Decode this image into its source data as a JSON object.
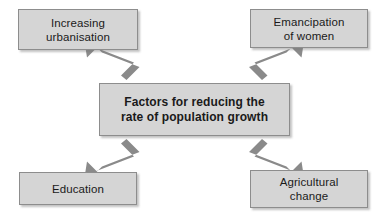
{
  "diagram": {
    "title": "Factors for reducing the rate of population growth",
    "type": "radial-concept-map",
    "colors": {
      "box_fill": "#d5d5d5",
      "box_border": "#8d8d8d",
      "arrow": "#8a8a8a",
      "text": "#1a1a1a",
      "background": "#ffffff"
    },
    "center": {
      "label": "Factors for reducing the\nrate of population growth"
    },
    "nodes": [
      {
        "id": "urbanisation",
        "label": "Increasing\nurbanisation",
        "position": "top-left"
      },
      {
        "id": "emancipation",
        "label": "Emancipation\nof women",
        "position": "top-right"
      },
      {
        "id": "education",
        "label": "Education",
        "position": "bottom-left"
      },
      {
        "id": "agriculture",
        "label": "Agricultural\nchange",
        "position": "bottom-right"
      }
    ],
    "connectors": [
      {
        "from": "center",
        "to": "urbanisation",
        "style": "single-arrow",
        "direction": "up-left"
      },
      {
        "from": "center",
        "to": "emancipation",
        "style": "single-arrow",
        "direction": "up-right"
      },
      {
        "from": "center",
        "to": "education",
        "style": "single-arrow",
        "direction": "down-left"
      },
      {
        "from": "center",
        "to": "agriculture",
        "style": "single-arrow",
        "direction": "down-right"
      }
    ]
  }
}
